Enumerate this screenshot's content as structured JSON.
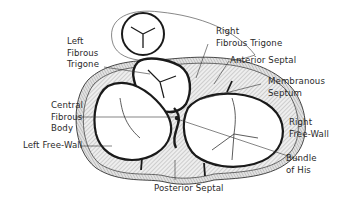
{
  "diagram": {
    "labels": [
      {
        "id": "left-fibrous-trigone",
        "text": "Left\nFibrous\nTrigone"
      },
      {
        "id": "right-fibrous-trigone",
        "text": "Right\nFibrous Trigone"
      },
      {
        "id": "anterior-septal",
        "text": "Anterior Septal"
      },
      {
        "id": "membranous-septum",
        "text": "Membranous\nSeptum"
      },
      {
        "id": "central-fibrous-body",
        "text": "Central\nFibrous\nBody"
      },
      {
        "id": "right-free-wall",
        "text": "Right\nFree-Wall"
      },
      {
        "id": "left-free-wall",
        "text": "Left Free-Wall"
      },
      {
        "id": "bundle-of-his",
        "text": "Bundle\nof His"
      },
      {
        "id": "posterior-septal",
        "text": "Posterior Septal"
      }
    ],
    "colors": {
      "ink": "#1a1a1a",
      "text": "#2a2a2a",
      "hatch_fill": "#d8d8d8",
      "background": "#ffffff"
    }
  }
}
